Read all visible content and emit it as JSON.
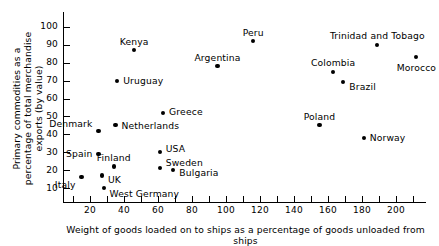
{
  "chart_data": {
    "type": "scatter",
    "title": "",
    "xlabel": "Weight of goods loaded on to ships as a percentage of goods unloaded from ships",
    "ylabel": "Primary commodities as a percentage of total merchandise exports (by value)",
    "xlim": [
      4,
      218
    ],
    "ylim": [
      4,
      106
    ],
    "grid": false,
    "legend": "none",
    "xticks": [
      10,
      20,
      30,
      40,
      50,
      60,
      70,
      80,
      90,
      100,
      110,
      120,
      130,
      140,
      150,
      160,
      170,
      180,
      190,
      200,
      210
    ],
    "xtick_labels": [
      {
        "value": 20,
        "text": "20"
      },
      {
        "value": 40,
        "text": "40"
      },
      {
        "value": 60,
        "text": "60"
      },
      {
        "value": 80,
        "text": "80"
      },
      {
        "value": 100,
        "text": "100"
      },
      {
        "value": 120,
        "text": "120"
      },
      {
        "value": 140,
        "text": "140"
      },
      {
        "value": 160,
        "text": "160"
      },
      {
        "value": 180,
        "text": "180"
      },
      {
        "value": 200,
        "text": "200"
      }
    ],
    "yticks": [
      10,
      20,
      30,
      40,
      50,
      60,
      70,
      80,
      90,
      100
    ],
    "ytick_labels": [
      "10",
      "20",
      "30",
      "40",
      "50",
      "60",
      "70",
      "80",
      "90",
      "100"
    ],
    "points": [
      {
        "name": "Peru",
        "x": 116,
        "y": 92,
        "label_dx": 0,
        "label_dy": -9,
        "label_align": "center"
      },
      {
        "name": "Kenya",
        "x": 46,
        "y": 87,
        "label_dx": 0,
        "label_dy": -9,
        "label_align": "center"
      },
      {
        "name": "Trinidad and Tobago",
        "x": 189,
        "y": 90,
        "label_dx": 0,
        "label_dy": -9,
        "label_align": "center"
      },
      {
        "name": "Morocco",
        "x": 212,
        "y": 83,
        "label_dx": 0,
        "label_dy": 10,
        "label_align": "center"
      },
      {
        "name": "Argentina",
        "x": 95,
        "y": 78,
        "label_dx": 0,
        "label_dy": -9,
        "label_align": "center"
      },
      {
        "name": "Colombia",
        "x": 163,
        "y": 75,
        "label_dx": 0,
        "label_dy": -9,
        "label_align": "center"
      },
      {
        "name": "Brazil",
        "x": 169,
        "y": 69,
        "label_dx": 6,
        "label_dy": 4,
        "label_align": "left"
      },
      {
        "name": "Uruguay",
        "x": 36,
        "y": 70,
        "label_dx": 6,
        "label_dy": 0,
        "label_align": "left"
      },
      {
        "name": "Greece",
        "x": 63,
        "y": 52,
        "label_dx": 6,
        "label_dy": -1,
        "label_align": "left"
      },
      {
        "name": "Poland",
        "x": 155,
        "y": 45,
        "label_dx": 0,
        "label_dy": -9,
        "label_align": "center"
      },
      {
        "name": "Netherlands",
        "x": 35,
        "y": 45,
        "label_dx": 6,
        "label_dy": 0,
        "label_align": "left"
      },
      {
        "name": "Denmark",
        "x": 25,
        "y": 42,
        "label_dx": -6,
        "label_dy": -7,
        "label_align": "right"
      },
      {
        "name": "Norway",
        "x": 181,
        "y": 38,
        "label_dx": 6,
        "label_dy": 0,
        "label_align": "left"
      },
      {
        "name": "USA",
        "x": 61,
        "y": 30,
        "label_dx": 6,
        "label_dy": -4,
        "label_align": "left"
      },
      {
        "name": "Spain",
        "x": 25,
        "y": 29,
        "label_dx": -6,
        "label_dy": 0,
        "label_align": "right"
      },
      {
        "name": "Finland",
        "x": 34,
        "y": 22,
        "label_dx": 0,
        "label_dy": -9,
        "label_align": "center"
      },
      {
        "name": "Sweden",
        "x": 61,
        "y": 21,
        "label_dx": 6,
        "label_dy": -6,
        "label_align": "left"
      },
      {
        "name": "Bulgaria",
        "x": 69,
        "y": 20,
        "label_dx": 6,
        "label_dy": 2,
        "label_align": "left"
      },
      {
        "name": "Italy",
        "x": 15,
        "y": 16,
        "label_dx": -6,
        "label_dy": 7,
        "label_align": "right"
      },
      {
        "name": "UK",
        "x": 27,
        "y": 17,
        "label_dx": 6,
        "label_dy": 4,
        "label_align": "left"
      },
      {
        "name": "West Germany",
        "x": 28,
        "y": 10,
        "label_dx": 6,
        "label_dy": 6,
        "label_align": "left"
      }
    ]
  }
}
